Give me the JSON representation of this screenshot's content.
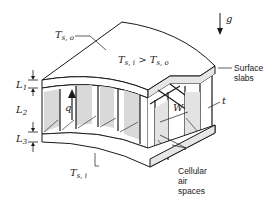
{
  "diagram": {
    "type": "cutaway-isometric",
    "labels": {
      "T_so": {
        "base": "T",
        "sub": "s, o"
      },
      "T_si": {
        "base": "T",
        "sub": "s, i"
      },
      "condition": {
        "left_base": "T",
        "left_sub": "s, i",
        "op": ">",
        "right_base": "T",
        "right_sub": "s, o"
      },
      "L1": {
        "base": "L",
        "sub": "1"
      },
      "L2": {
        "base": "L",
        "sub": "2"
      },
      "L3": {
        "base": "L",
        "sub": "3"
      },
      "q": "q",
      "g": "g",
      "W": "W",
      "t": "t",
      "surface_slabs_line1": "Surface",
      "surface_slabs_line2": "slabs",
      "cellular_line1": "Cellular",
      "cellular_line2": "air",
      "cellular_line3": "spaces"
    },
    "colors": {
      "stroke": "#1a1a1a",
      "shade": "#d9d9d9",
      "light": "#eeeeee",
      "background": "#ffffff"
    }
  }
}
